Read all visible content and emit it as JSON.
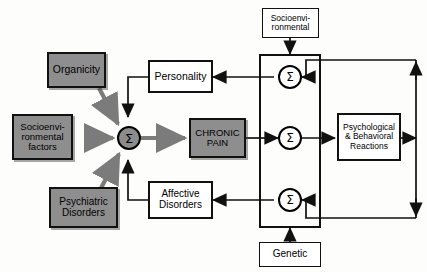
{
  "diagram": {
    "background_color": "#fdfdfc",
    "line_color": "#111111",
    "shaded_fill": "#8e8e8e",
    "plain_fill": "#ffffff",
    "sigma_dark_fill": "#8c8c8c",
    "sigma_symbol": "Σ",
    "nodes": {
      "organicity": {
        "label": "Organicity",
        "style": "shaded"
      },
      "socioenvironmental_factors": {
        "label": "Socioenvi-\nronmental\nfactors",
        "line1": "Socioenvi-",
        "line2": "ronmental",
        "line3": "factors",
        "style": "shaded"
      },
      "psychiatric_disorders": {
        "label": "Psychiatric\nDisorders",
        "line1": "Psychiatric",
        "line2": "Disorders",
        "style": "shaded"
      },
      "chronic_pain": {
        "label": "CHRONIC\nPAIN",
        "line1": "CHRONIC",
        "line2": "PAIN",
        "style": "shaded"
      },
      "personality": {
        "label": "Personality",
        "style": "plain"
      },
      "affective_disorders": {
        "label": "Affective\nDisorders",
        "line1": "Affective",
        "line2": "Disorders",
        "style": "plain"
      },
      "socioenvironmental_top": {
        "label": "Socioenvi-\nronmental",
        "line1": "Socioenvi-",
        "line2": "ronmental",
        "style": "plain"
      },
      "genetic": {
        "label": "Genetic",
        "style": "plain"
      },
      "psychological_behavioral_reactions": {
        "label": "Psychological\n& Behavioral\nReactions",
        "line1": "Psychological",
        "line2": "& Behavioral",
        "line3": "Reactions",
        "style": "plain"
      }
    },
    "summation_nodes": [
      {
        "name": "central-summation",
        "symbol": "Σ",
        "style": "dark"
      },
      {
        "name": "upper-summation",
        "symbol": "Σ",
        "style": "light"
      },
      {
        "name": "middle-summation",
        "symbol": "Σ",
        "style": "light"
      },
      {
        "name": "lower-summation",
        "symbol": "Σ",
        "style": "light"
      }
    ],
    "edges": [
      {
        "from": "organicity",
        "to": "central-summation",
        "style": "thick-gray"
      },
      {
        "from": "socioenvironmental_factors",
        "to": "central-summation",
        "style": "thick-gray"
      },
      {
        "from": "psychiatric_disorders",
        "to": "central-summation",
        "style": "thick-gray"
      },
      {
        "from": "personality",
        "to": "central-summation",
        "style": "thin-black"
      },
      {
        "from": "affective_disorders",
        "to": "central-summation",
        "style": "thin-black"
      },
      {
        "from": "central-summation",
        "to": "chronic_pain",
        "style": "thick-gray"
      },
      {
        "from": "chronic_pain",
        "to": "middle-summation",
        "style": "thin-black"
      },
      {
        "from": "upper-summation",
        "to": "personality",
        "style": "thin-black"
      },
      {
        "from": "lower-summation",
        "to": "affective_disorders",
        "style": "thin-black"
      },
      {
        "from": "socioenvironmental_top",
        "to": "modulator-panel",
        "style": "thin-black"
      },
      {
        "from": "genetic",
        "to": "modulator-panel",
        "style": "thin-black"
      },
      {
        "from": "middle-summation",
        "to": "psychological_behavioral_reactions",
        "style": "thin-black"
      },
      {
        "from": "psychological_behavioral_reactions",
        "to": "right-feedback-bus",
        "style": "thin-black"
      },
      {
        "from": "right-feedback-bus",
        "to": "upper-summation",
        "style": "thin-black"
      },
      {
        "from": "right-feedback-bus",
        "to": "lower-summation",
        "style": "thin-black"
      }
    ]
  }
}
